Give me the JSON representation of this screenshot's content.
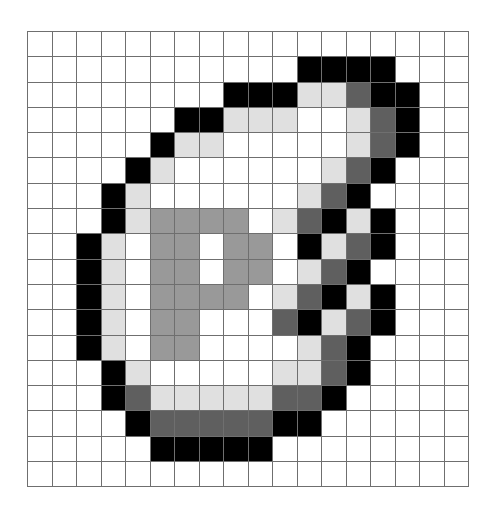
{
  "grid": {
    "columns": 18,
    "rows": 18,
    "palette": {
      ".": "#ffffff",
      "L": "#e0e0e0",
      "M": "#999999",
      "D": "#5f5f5f",
      "B": "#000000"
    },
    "palette_names": {
      ".": "white",
      "L": "light-gray",
      "M": "mid-gray",
      "D": "dark-gray",
      "B": "black"
    },
    "line_color": "#6f6f6f",
    "cells": [
      "..................",
      "...........BBBB...",
      "........BBBLLDBB..",
      "......BBLLL..LDB..",
      ".....BLL.....LDB..",
      "....BL......LDB...",
      "...BL......LDB....",
      "...BLMMMM.LDBLB...",
      "..BL.MM.MM.BLDB...",
      "..BL.MM.MM.LDB....",
      "..BL.MMMM.LDBLB...",
      "..BL.MM...DBLDB...",
      "..BL.MM....LDB....",
      "...BL.....LLDB....",
      "...BDLLLLLDDB.....",
      "....BDDDDDBB......",
      ".....BBBBB........",
      ".................."
    ]
  }
}
